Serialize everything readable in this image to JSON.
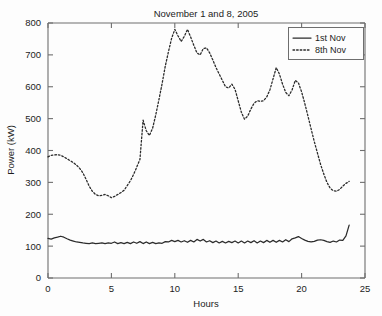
{
  "chart_data": {
    "type": "line",
    "title": "November 1 and 8, 2005",
    "xlabel": "Hours",
    "ylabel": "Power (kW)",
    "xlim": [
      0,
      25
    ],
    "ylim": [
      0,
      800
    ],
    "xticks": [
      0,
      5,
      10,
      15,
      20,
      25
    ],
    "yticks": [
      0,
      100,
      200,
      300,
      400,
      500,
      600,
      700,
      800
    ],
    "xtick_labels": [
      "0",
      "5",
      "10",
      "15",
      "20",
      "25"
    ],
    "ytick_labels": [
      "0",
      "100",
      "200",
      "300",
      "400",
      "500",
      "600",
      "700",
      "800"
    ],
    "grid": false,
    "legend_position": "top-right",
    "legend": [
      {
        "label": "1st Nov",
        "style": "solid"
      },
      {
        "label": "8th Nov",
        "style": "dotted"
      }
    ],
    "x": [
      0,
      0.25,
      0.5,
      0.75,
      1,
      1.25,
      1.5,
      1.75,
      2,
      2.25,
      2.5,
      2.75,
      3,
      3.25,
      3.5,
      3.75,
      4,
      4.25,
      4.5,
      4.75,
      5,
      5.25,
      5.5,
      5.75,
      6,
      6.25,
      6.5,
      6.75,
      7,
      7.25,
      7.5,
      7.75,
      8,
      8.25,
      8.5,
      8.75,
      9,
      9.25,
      9.5,
      9.75,
      10,
      10.25,
      10.5,
      10.75,
      11,
      11.25,
      11.5,
      11.75,
      12,
      12.25,
      12.5,
      12.75,
      13,
      13.25,
      13.5,
      13.75,
      14,
      14.25,
      14.5,
      14.75,
      15,
      15.25,
      15.5,
      15.75,
      16,
      16.25,
      16.5,
      16.75,
      17,
      17.25,
      17.5,
      17.75,
      18,
      18.25,
      18.5,
      18.75,
      19,
      19.25,
      19.5,
      19.75,
      20,
      20.25,
      20.5,
      20.75,
      21,
      21.25,
      21.5,
      21.75,
      22,
      22.25,
      22.5,
      22.75,
      23,
      23.25,
      23.5,
      23.75
    ],
    "series": [
      {
        "name": "1st Nov",
        "style": "solid",
        "values": [
          124,
          122,
          126,
          128,
          131,
          128,
          123,
          119,
          116,
          113,
          112,
          110,
          109,
          108,
          110,
          108,
          109,
          110,
          108,
          110,
          109,
          113,
          108,
          111,
          108,
          112,
          108,
          113,
          109,
          114,
          108,
          113,
          108,
          112,
          108,
          110,
          109,
          114,
          113,
          118,
          114,
          118,
          113,
          117,
          112,
          118,
          113,
          121,
          116,
          121,
          113,
          117,
          111,
          116,
          110,
          115,
          110,
          115,
          111,
          116,
          110,
          116,
          110,
          116,
          111,
          117,
          110,
          116,
          111,
          118,
          112,
          118,
          112,
          118,
          113,
          120,
          114,
          123,
          126,
          130,
          124,
          119,
          115,
          113,
          115,
          119,
          120,
          118,
          114,
          112,
          116,
          113,
          119,
          118,
          132,
          166
        ]
      },
      {
        "name": "8th Nov",
        "style": "dotted",
        "values": [
          380,
          385,
          386,
          387,
          385,
          380,
          374,
          368,
          362,
          354,
          344,
          330,
          310,
          288,
          272,
          262,
          258,
          259,
          262,
          258,
          252,
          256,
          262,
          268,
          275,
          290,
          305,
          325,
          348,
          372,
          495,
          462,
          447,
          470,
          512,
          560,
          610,
          665,
          710,
          752,
          780,
          760,
          742,
          758,
          780,
          756,
          730,
          706,
          700,
          720,
          722,
          706,
          684,
          660,
          640,
          620,
          600,
          596,
          608,
          592,
          556,
          520,
          498,
          508,
          530,
          548,
          556,
          554,
          556,
          568,
          590,
          625,
          660,
          640,
          608,
          582,
          572,
          590,
          620,
          612,
          584,
          548,
          508,
          468,
          428,
          392,
          356,
          326,
          300,
          282,
          274,
          272,
          278,
          288,
          297,
          303
        ]
      }
    ]
  }
}
